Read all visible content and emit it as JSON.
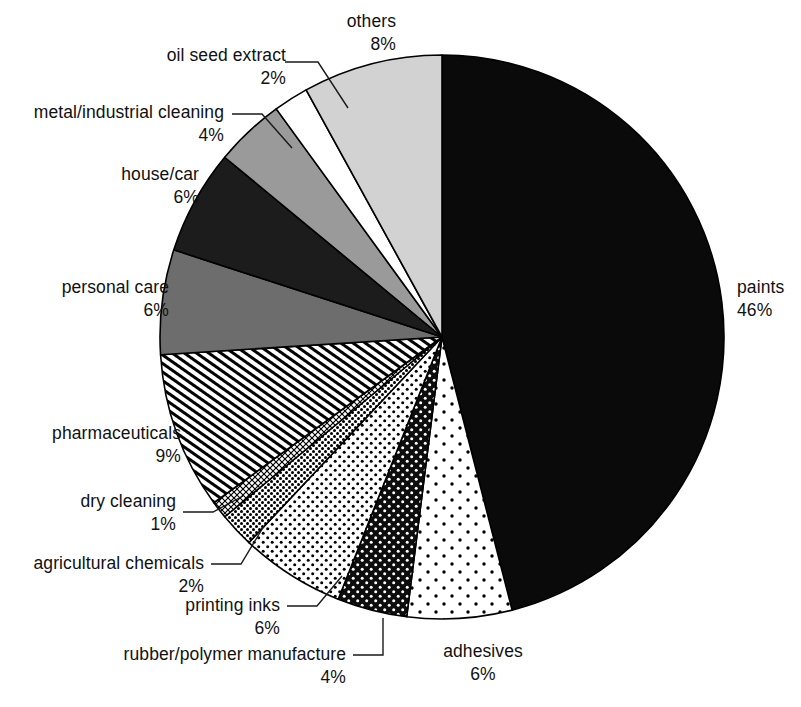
{
  "chart_data": {
    "type": "pie",
    "title": "",
    "subtitle": "",
    "units": "percent",
    "total": 100,
    "start_angle_deg": 0,
    "direction": "clockwise",
    "legend": "none (direct labels with leader lines)",
    "center": {
      "x": 442,
      "y": 337
    },
    "radius": 282,
    "categories": [
      "paints",
      "adhesives",
      "rubber/polymer manufacture",
      "printing inks",
      "agricultural chemicals",
      "dry cleaning",
      "pharmaceuticals",
      "personal care",
      "house/car",
      "metal/industrial cleaning",
      "oil seed extract",
      "others"
    ],
    "values": [
      46,
      6,
      4,
      6,
      2,
      1,
      9,
      6,
      6,
      4,
      2,
      8
    ],
    "slices": [
      {
        "label": "paints",
        "value": 46,
        "pct_text": "46%",
        "fill": "solid-black",
        "color": "#0a0a0a"
      },
      {
        "label": "adhesives",
        "value": 6,
        "pct_text": "6%",
        "fill": "sparse-dots",
        "color": "#ffffff"
      },
      {
        "label": "rubber/polymer manufacture",
        "value": 4,
        "pct_text": "4%",
        "fill": "black-dots",
        "color": "#111111"
      },
      {
        "label": "printing inks",
        "value": 6,
        "pct_text": "6%",
        "fill": "medium-dots",
        "color": "#ffffff"
      },
      {
        "label": "agricultural chemicals",
        "value": 2,
        "pct_text": "2%",
        "fill": "dense-dots",
        "color": "#2a2a2a"
      },
      {
        "label": "dry cleaning",
        "value": 1,
        "pct_text": "1%",
        "fill": "crosshatch",
        "color": "#ffffff"
      },
      {
        "label": "pharmaceuticals",
        "value": 9,
        "pct_text": "9%",
        "fill": "diagonal-hatch",
        "color": "#ffffff"
      },
      {
        "label": "personal care",
        "value": 6,
        "pct_text": "6%",
        "fill": "solid-gray",
        "color": "#6d6d6d"
      },
      {
        "label": "house/car",
        "value": 6,
        "pct_text": "6%",
        "fill": "solid-darkest",
        "color": "#1c1c1c"
      },
      {
        "label": "metal/industrial cleaning",
        "value": 4,
        "pct_text": "4%",
        "fill": "solid-midgray",
        "color": "#9a9a9a"
      },
      {
        "label": "oil seed extract",
        "value": 2,
        "pct_text": "2%",
        "fill": "solid-white",
        "color": "#ffffff"
      },
      {
        "label": "others",
        "value": 8,
        "pct_text": "8%",
        "fill": "solid-litegray",
        "color": "#d2d2d2"
      }
    ]
  },
  "labels": {
    "others": {
      "name": "others",
      "pct": "8%"
    },
    "oil_seed": {
      "name": "oil seed extract",
      "pct": "2%"
    },
    "metal": {
      "name": "metal/industrial cleaning",
      "pct": "4%"
    },
    "house_car": {
      "name": "house/car",
      "pct": "6%"
    },
    "personal": {
      "name": "personal care",
      "pct": "6%"
    },
    "pharma": {
      "name": "pharmaceuticals",
      "pct": "9%"
    },
    "dry_clean": {
      "name": "dry cleaning",
      "pct": "1%"
    },
    "agri": {
      "name": "agricultural chemicals",
      "pct": "2%"
    },
    "printing": {
      "name": "printing inks",
      "pct": "6%"
    },
    "rubber": {
      "name": "rubber/polymer manufacture",
      "pct": "4%"
    },
    "adhesives": {
      "name": "adhesives",
      "pct": "6%"
    },
    "paints": {
      "name": "paints",
      "pct": "46%"
    }
  }
}
